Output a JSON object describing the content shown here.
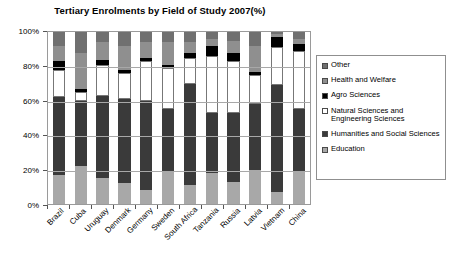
{
  "chart_data": {
    "type": "bar",
    "subtype": "stacked-100-percent",
    "title": "Tertiary Enrolments by Field of Study 2007(%)",
    "xlabel": "",
    "ylabel": "",
    "ylim": [
      0,
      100
    ],
    "ytick_labels": [
      "0%",
      "20%",
      "40%",
      "60%",
      "80%",
      "100%"
    ],
    "ytick_values": [
      0,
      20,
      40,
      60,
      80,
      100
    ],
    "grid": true,
    "legend_position": "right",
    "categories": [
      "Brazil",
      "Cuba",
      "Uruguay",
      "Denmark",
      "Germany",
      "Sweden",
      "South Africa",
      "Tanzania",
      "Russia",
      "Latvia",
      "Vietnam",
      "China"
    ],
    "series": [
      {
        "name": "Education",
        "color": "#a8a8a8",
        "values": [
          17,
          22,
          15,
          12,
          8,
          19,
          11,
          18,
          13,
          20,
          7,
          19
        ]
      },
      {
        "name": "Humanities and Social Sciences",
        "color": "#3a3a3a",
        "values": [
          45,
          38,
          48,
          49,
          52,
          36,
          59,
          35,
          40,
          38,
          62,
          36
        ]
      },
      {
        "name": "Natural Sciences and Engineering Sciences",
        "color": "#ffffff",
        "values": [
          16,
          5,
          18,
          15,
          23,
          24,
          15,
          33,
          30,
          17,
          22,
          34
        ]
      },
      {
        "name": "Agro Sciences",
        "color": "#000000",
        "values": [
          5,
          2,
          3,
          2,
          2,
          2,
          3,
          6,
          5,
          2,
          6,
          4
        ]
      },
      {
        "name": "Health and Welfare",
        "color": "#8f8f8f",
        "values": [
          9,
          21,
          10,
          14,
          9,
          13,
          6,
          4,
          7,
          15,
          2,
          3
        ]
      },
      {
        "name": "Other",
        "color": "#707070",
        "values": [
          8,
          12,
          6,
          8,
          6,
          6,
          6,
          4,
          5,
          8,
          1,
          4
        ]
      }
    ]
  },
  "legend": {
    "items": [
      {
        "label": "Other",
        "color": "#707070"
      },
      {
        "label": "Health and Welfare",
        "color": "#8f8f8f"
      },
      {
        "label": "Agro Sciences",
        "color": "#000000"
      },
      {
        "label": "Natural Sciences and Engineering Sciences",
        "color": "#ffffff"
      },
      {
        "label": "Humanities and Social Sciences",
        "color": "#3a3a3a"
      },
      {
        "label": "Education",
        "color": "#a8a8a8"
      }
    ]
  },
  "colors": {
    "plot_background": "#ffffff",
    "gridline": "#a8a8a8",
    "axis": "#555555",
    "text": "#000000",
    "legend_border": "#8f8f8f"
  }
}
